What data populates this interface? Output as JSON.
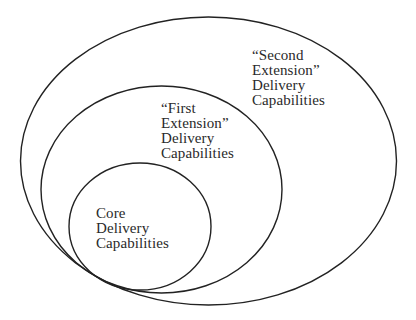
{
  "diagram": {
    "type": "nested-ellipses",
    "regions": [
      {
        "id": "second-extension",
        "lines": [
          "“Second",
          "Extension”",
          "Delivery",
          "Capabilities"
        ],
        "label": "“Second Extension” Delivery Capabilities"
      },
      {
        "id": "first-extension",
        "lines": [
          "“First",
          "Extension”",
          "Delivery",
          "Capabilities"
        ],
        "label": "“First Extension” Delivery Capabilities"
      },
      {
        "id": "core",
        "lines": [
          "Core",
          "Delivery",
          "Capabilities"
        ],
        "label": "Core Delivery Capabilities"
      }
    ],
    "colors": {
      "stroke": "#222222",
      "text": "#2a2a2a",
      "background": "#ffffff"
    }
  }
}
